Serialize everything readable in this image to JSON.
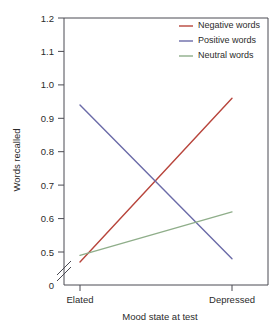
{
  "chart_data": {
    "type": "line",
    "title": "",
    "xlabel": "Mood state at test",
    "ylabel": "Words recalled",
    "categories": [
      "Elated",
      "Depressed"
    ],
    "x": [
      0,
      1
    ],
    "ylim": [
      0.45,
      1.2
    ],
    "ytick_labels": [
      "0",
      "0.5",
      "0.6",
      "0.7",
      "0.8",
      "0.9",
      "1.0",
      "1.1",
      "1.2"
    ],
    "ytick_values": [
      0,
      0.5,
      0.6,
      0.7,
      0.8,
      0.9,
      1.0,
      1.1,
      1.2
    ],
    "axis_break": true,
    "axis_break_between": [
      0,
      0.5
    ],
    "grid": false,
    "legend_position": "top-right",
    "series": [
      {
        "name": "Negative words",
        "values": [
          0.47,
          0.96
        ],
        "color": "#b8453c"
      },
      {
        "name": "Positive words",
        "values": [
          0.94,
          0.48
        ],
        "color": "#6b6ba8"
      },
      {
        "name": "Neutral words",
        "values": [
          0.49,
          0.62
        ],
        "color": "#8fae8a"
      }
    ]
  },
  "axes": {
    "y_title": "Words recalled",
    "x_title": "Mood state at test",
    "y_ticks": [
      {
        "label": "1.2",
        "value": 1.2
      },
      {
        "label": "1.1",
        "value": 1.1
      },
      {
        "label": "1.0",
        "value": 1.0
      },
      {
        "label": "0.9",
        "value": 0.9
      },
      {
        "label": "0.8",
        "value": 0.8
      },
      {
        "label": "0.7",
        "value": 0.7
      },
      {
        "label": "0.6",
        "value": 0.6
      },
      {
        "label": "0.5",
        "value": 0.5
      },
      {
        "label": "0",
        "value": 0
      }
    ],
    "x_ticks": [
      {
        "label": "Elated"
      },
      {
        "label": "Depressed"
      }
    ]
  },
  "legend": {
    "entries": [
      {
        "label": "Negative words",
        "color": "#b8453c"
      },
      {
        "label": "Positive words",
        "color": "#6b6ba8"
      },
      {
        "label": "Neutral words",
        "color": "#8fae8a"
      }
    ]
  },
  "colors": {
    "negative": "#b8453c",
    "positive": "#6b6ba8",
    "neutral": "#8fae8a",
    "axis": "#4a4a52",
    "text": "#2b2b2b",
    "background": "#ffffff"
  }
}
